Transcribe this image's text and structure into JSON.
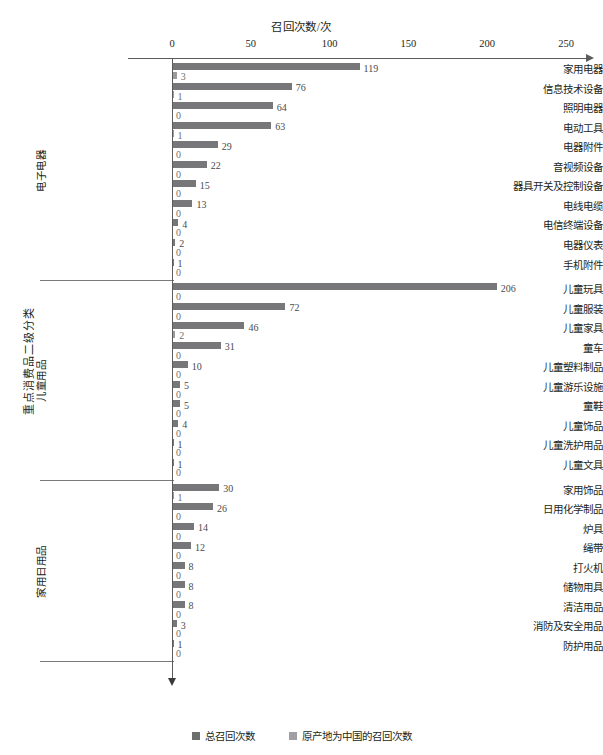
{
  "chart_data": {
    "type": "bar",
    "orientation": "horizontal",
    "title": "",
    "xlabel": "召回次数/次",
    "ylabel": "重点消费品二级分类",
    "xlim": [
      0,
      250
    ],
    "xticks": [
      0,
      50,
      100,
      150,
      200,
      250
    ],
    "grid": false,
    "legend_position": "bottom",
    "series": [
      {
        "name": "总召回次数",
        "color": "#77777a",
        "key": "total"
      },
      {
        "name": "原产地为中国的召回次数",
        "color": "#9b9b9e",
        "key": "china"
      }
    ],
    "groups": [
      {
        "label": "电子电器",
        "categories": [
          {
            "label": "家用电器",
            "total": 119,
            "china": 3
          },
          {
            "label": "信息技术设备",
            "total": 76,
            "china": 1
          },
          {
            "label": "照明电器",
            "total": 64,
            "china": 0
          },
          {
            "label": "电动工具",
            "total": 63,
            "china": 1
          },
          {
            "label": "电器附件",
            "total": 29,
            "china": 0
          },
          {
            "label": "音视频设备",
            "total": 22,
            "china": 0
          },
          {
            "label": "器具开关及控制设备",
            "total": 15,
            "china": 0
          },
          {
            "label": "电线电缆",
            "total": 13,
            "china": 0
          },
          {
            "label": "电信终端设备",
            "total": 4,
            "china": 0
          },
          {
            "label": "电器仪表",
            "total": 2,
            "china": 0
          },
          {
            "label": "手机附件",
            "total": 1,
            "china": 0
          }
        ]
      },
      {
        "label": "儿童用品",
        "categories": [
          {
            "label": "儿童玩具",
            "total": 206,
            "china": 0
          },
          {
            "label": "儿童服装",
            "total": 72,
            "china": 0
          },
          {
            "label": "儿童家具",
            "total": 46,
            "china": 2
          },
          {
            "label": "童车",
            "total": 31,
            "china": 0
          },
          {
            "label": "儿童塑料制品",
            "total": 10,
            "china": 0
          },
          {
            "label": "儿童游乐设施",
            "total": 5,
            "china": 0
          },
          {
            "label": "童鞋",
            "total": 5,
            "china": 0
          },
          {
            "label": "儿童饰品",
            "total": 4,
            "china": 0
          },
          {
            "label": "儿童洗护用品",
            "total": 1,
            "china": 0
          },
          {
            "label": "儿童文具",
            "total": 1,
            "china": 0
          }
        ]
      },
      {
        "label": "家用日用品",
        "categories": [
          {
            "label": "家用饰品",
            "total": 30,
            "china": 1
          },
          {
            "label": "日用化学制品",
            "total": 26,
            "china": 0
          },
          {
            "label": "炉具",
            "total": 14,
            "china": 0
          },
          {
            "label": "绳带",
            "total": 12,
            "china": 0
          },
          {
            "label": "打火机",
            "total": 8,
            "china": 0
          },
          {
            "label": "储物用具",
            "total": 8,
            "china": 0
          },
          {
            "label": "清洁用品",
            "total": 8,
            "china": 0
          },
          {
            "label": "消防及安全用品",
            "total": 3,
            "china": 0
          },
          {
            "label": "防护用品",
            "total": 1,
            "china": 0
          }
        ]
      }
    ]
  }
}
